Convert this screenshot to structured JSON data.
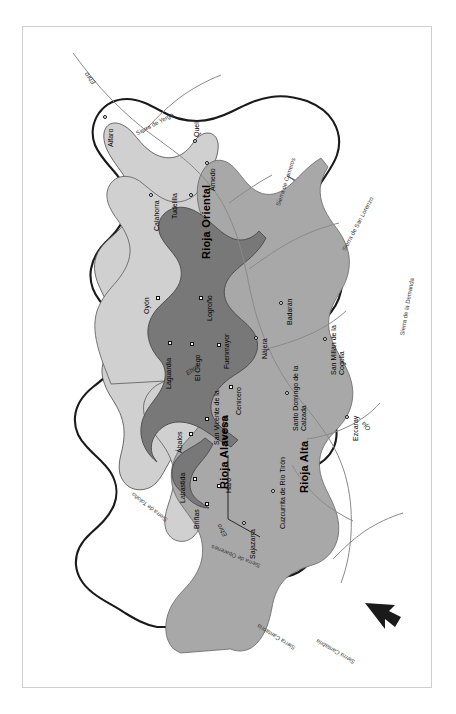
{
  "map": {
    "title": "Rioja wine region",
    "orientation": "rotated 90 degrees counter-clockwise",
    "frame_color": "#cfcfcf",
    "background": "#ffffff",
    "regions": [
      {
        "id": "rioja-alavesa",
        "label": "Rioja Alavesa",
        "fill": "#787878",
        "label_has_leader_line": true
      },
      {
        "id": "rioja-alta",
        "label": "Rioja Alta",
        "fill": "#a8a8a8",
        "label_has_leader_line": false
      },
      {
        "id": "rioja-oriental",
        "label": "Rioja Oriental",
        "fill": "#d0d0d0",
        "label_has_leader_line": false
      }
    ],
    "towns": [
      {
        "name": "Oyón",
        "region": "rioja-alavesa",
        "marker": "square"
      },
      {
        "name": "Laguardia",
        "region": "rioja-alavesa",
        "marker": "square"
      },
      {
        "name": "El Ciego",
        "region": "rioja-alavesa",
        "marker": "square"
      },
      {
        "name": "San Vicente\nde la Sonsierra",
        "region": "rioja-alavesa",
        "marker": "square"
      },
      {
        "name": "Ábalos",
        "region": "rioja-alavesa",
        "marker": "square"
      },
      {
        "name": "Labastida",
        "region": "rioja-alavesa",
        "marker": "square"
      },
      {
        "name": "Briñas",
        "region": "rioja-alta",
        "marker": "square"
      },
      {
        "name": "Haro",
        "region": "rioja-alta",
        "marker": "square"
      },
      {
        "name": "Sajazarra",
        "region": "rioja-alta",
        "marker": "circle"
      },
      {
        "name": "Cuzcurrita\nde Río Tirón",
        "region": "rioja-alta",
        "marker": "circle"
      },
      {
        "name": "Cenicero",
        "region": "rioja-alta",
        "marker": "square"
      },
      {
        "name": "Fuenmayor",
        "region": "rioja-alta",
        "marker": "square"
      },
      {
        "name": "Logroño",
        "region": "rioja-alta",
        "marker": "square"
      },
      {
        "name": "Nájera",
        "region": "rioja-alta",
        "marker": "circle"
      },
      {
        "name": "Badarán",
        "region": "rioja-alta",
        "marker": "circle"
      },
      {
        "name": "Santo Domingo\nde la Calzada",
        "region": "rioja-alta",
        "marker": "circle"
      },
      {
        "name": "San Millán\nde la Cogolla",
        "region": "outside",
        "marker": "circle"
      },
      {
        "name": "Ezcaray",
        "region": "outside",
        "marker": "circle"
      },
      {
        "name": "Tudelilla",
        "region": "rioja-oriental",
        "marker": "circle"
      },
      {
        "name": "Calahorra",
        "region": "rioja-oriental",
        "marker": "circle"
      },
      {
        "name": "Arnedo",
        "region": "rioja-oriental",
        "marker": "circle"
      },
      {
        "name": "Quel",
        "region": "rioja-oriental",
        "marker": "circle"
      },
      {
        "name": "Alfaro",
        "region": "rioja-oriental",
        "marker": "circle"
      }
    ],
    "rivers": [
      {
        "name": "Ebro",
        "instance": "top-right"
      },
      {
        "name": "Ebro",
        "instance": "middle"
      },
      {
        "name": "Ebro",
        "instance": "west"
      },
      {
        "name": "Oja",
        "instance": "south-west"
      }
    ],
    "mountain_ranges": [
      {
        "name": "Sierra Cantabria"
      },
      {
        "name": "Sierra de Obarenes"
      },
      {
        "name": "Sierra de Toloño"
      },
      {
        "name": "Sierra de la Demanda"
      },
      {
        "name": "Sierra de San Lorenzo"
      },
      {
        "name": "Sierra de Cameros"
      },
      {
        "name": "Sierra de Yerga"
      }
    ],
    "compass": {
      "name": "north-arrow",
      "points": "north-west"
    }
  }
}
